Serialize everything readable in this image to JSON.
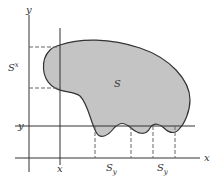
{
  "diagram": {
    "axes": {
      "x_axis_label": "x",
      "y_axis_label": "y"
    },
    "region": {
      "label": "S",
      "fill": "#c4c4c4",
      "stroke": "#333333"
    },
    "markers": {
      "x_value_label": "x",
      "y_value_label": "y",
      "section_x_label": "S",
      "section_x_sup": "x",
      "section_y_label_1": "S",
      "section_y_sub_1": "y",
      "section_y_label_2": "S",
      "section_y_sub_2": "y"
    },
    "colors": {
      "line": "#333333",
      "dashed": "#666666",
      "background": "#ffffff"
    }
  }
}
